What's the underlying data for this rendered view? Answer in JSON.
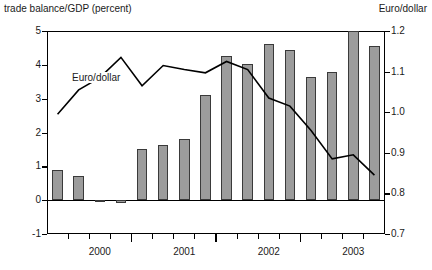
{
  "axes": {
    "left_title": "trade balance/GDP (percent)",
    "right_title": "Euro/dollar",
    "left_ticks": [
      "5",
      "4",
      "3",
      "2",
      "1",
      "0",
      "-1"
    ],
    "right_ticks": [
      "1.2",
      "1.1",
      "1.0",
      "0.9",
      "0.8",
      "0.7"
    ],
    "x_labels": [
      "2000",
      "2001",
      "2002",
      "2003"
    ]
  },
  "annotations": {
    "series_label": "Euro/dollar"
  },
  "chart_data": {
    "type": "bar",
    "title": "",
    "xlabel": "",
    "ylabel": "trade balance/GDP (percent)",
    "ylabel_right": "Euro/dollar",
    "ylim": [
      -1,
      5
    ],
    "ylim_right": [
      0.7,
      1.2
    ],
    "yticks": [
      -1,
      0,
      1,
      2,
      3,
      4,
      5
    ],
    "yticks_right": [
      0.7,
      0.8,
      0.9,
      1.0,
      1.1,
      1.2
    ],
    "grid": false,
    "legend": "inline-annotation",
    "x_tick_labels": [
      "2000",
      "2001",
      "2002",
      "2003"
    ],
    "x_tick_label_positions": [
      2.5,
      6.5,
      10.5,
      14.5
    ],
    "categories": [
      "1999Q3",
      "1999Q4",
      "2000Q1",
      "2000Q2",
      "2000Q3",
      "2000Q4",
      "2001Q1",
      "2001Q2",
      "2001Q3",
      "2001Q4",
      "2002Q1",
      "2002Q2",
      "2002Q3",
      "2002Q4",
      "2003Q1",
      "2003Q2"
    ],
    "series": [
      {
        "name": "trade balance/GDP (percent)",
        "type": "bar",
        "axis": "left",
        "color": "#9c9c9c",
        "edge_color": "#3a3a3a",
        "values": [
          0.88,
          0.7,
          -0.05,
          -0.08,
          1.52,
          1.62,
          1.8,
          3.12,
          4.25,
          4.02,
          4.62,
          4.45,
          3.65,
          3.78,
          5.0,
          4.55
        ]
      },
      {
        "name": "Euro/dollar",
        "type": "line",
        "axis": "right",
        "color": "#000000",
        "values": [
          0.995,
          1.055,
          1.085,
          1.135,
          1.065,
          1.115,
          1.105,
          1.097,
          1.125,
          1.105,
          1.035,
          1.015,
          0.955,
          0.885,
          0.895,
          0.845
        ]
      }
    ]
  }
}
